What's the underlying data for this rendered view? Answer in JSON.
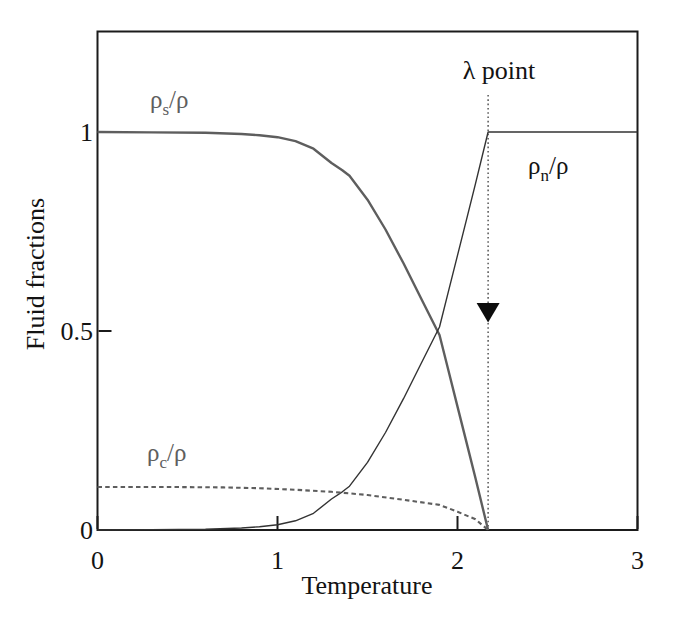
{
  "figure": {
    "ylabel": "Fluid fractions",
    "xlabel": "Temperature",
    "x_ticks": [
      {
        "value": 0,
        "label": "0"
      },
      {
        "value": 1,
        "label": "1"
      },
      {
        "value": 2,
        "label": "2"
      },
      {
        "value": 3,
        "label": "3"
      }
    ],
    "y_ticks": [
      {
        "value": 0,
        "label": "0"
      },
      {
        "value": 0.5,
        "label": "0.5"
      },
      {
        "value": 1,
        "label": "1"
      }
    ],
    "curve_labels": {
      "superfluid": {
        "pre": "ρ",
        "sub": "s",
        "post": "/ρ"
      },
      "normal": {
        "pre": "ρ",
        "sub": "n",
        "post": "/ρ"
      },
      "condensate": {
        "pre": "ρ",
        "sub": "c",
        "post": "/ρ"
      }
    },
    "lambda_label": "λ point",
    "colors": {
      "gray_curve": "#5e5e5e",
      "dark_curve": "#333333",
      "axis": "#1b1b1b",
      "text": "#131313",
      "arrow": "#0d0d0d",
      "background": "#ffffff"
    }
  },
  "chart_data": {
    "type": "line",
    "title": "",
    "xlabel": "Temperature",
    "ylabel": "Fluid fractions",
    "xlim": [
      0,
      3
    ],
    "ylim": [
      0,
      1.25
    ],
    "x_ticks": [
      0,
      1,
      2,
      3
    ],
    "y_ticks": [
      0,
      0.5,
      1
    ],
    "grid": false,
    "legend": "inline-labels",
    "series": [
      {
        "key": "superfluid",
        "name": "ρs/ρ",
        "style": "solid",
        "color": "#5e5e5e",
        "width": 2.4,
        "dash": null,
        "points": [
          [
            0,
            1.0
          ],
          [
            0.3,
            0.999
          ],
          [
            0.6,
            0.998
          ],
          [
            0.8,
            0.995
          ],
          [
            0.9,
            0.992
          ],
          [
            1.0,
            0.987
          ],
          [
            1.1,
            0.977
          ],
          [
            1.2,
            0.958
          ],
          [
            1.3,
            0.922
          ],
          [
            1.36,
            0.904
          ],
          [
            1.4,
            0.89
          ],
          [
            1.5,
            0.83
          ],
          [
            1.6,
            0.755
          ],
          [
            1.7,
            0.67
          ],
          [
            1.8,
            0.58
          ],
          [
            1.9,
            0.49
          ],
          [
            1.95,
            0.4
          ],
          [
            2.0,
            0.31
          ],
          [
            2.05,
            0.22
          ],
          [
            2.1,
            0.13
          ],
          [
            2.17,
            0.0
          ]
        ]
      },
      {
        "key": "normal",
        "name": "ρn/ρ",
        "style": "solid",
        "color": "#333333",
        "width": 1.4,
        "dash": null,
        "points": [
          [
            0,
            0.0
          ],
          [
            0.3,
            0.001
          ],
          [
            0.6,
            0.002
          ],
          [
            0.8,
            0.005
          ],
          [
            0.9,
            0.008
          ],
          [
            1.0,
            0.013
          ],
          [
            1.1,
            0.023
          ],
          [
            1.2,
            0.042
          ],
          [
            1.3,
            0.078
          ],
          [
            1.36,
            0.096
          ],
          [
            1.4,
            0.11
          ],
          [
            1.5,
            0.17
          ],
          [
            1.6,
            0.245
          ],
          [
            1.7,
            0.33
          ],
          [
            1.8,
            0.42
          ],
          [
            1.9,
            0.51
          ],
          [
            1.95,
            0.6
          ],
          [
            2.0,
            0.69
          ],
          [
            2.05,
            0.78
          ],
          [
            2.1,
            0.87
          ],
          [
            2.17,
            1.0
          ],
          [
            3.0,
            1.0
          ]
        ]
      },
      {
        "key": "condensate",
        "name": "ρc/ρ",
        "style": "dashed",
        "color": "#5e5e5e",
        "width": 2.1,
        "dash": "4.5 3.2",
        "points": [
          [
            0,
            0.108
          ],
          [
            0.4,
            0.108
          ],
          [
            0.7,
            0.107
          ],
          [
            0.9,
            0.105
          ],
          [
            1.1,
            0.101
          ],
          [
            1.3,
            0.096
          ],
          [
            1.5,
            0.088
          ],
          [
            1.7,
            0.076
          ],
          [
            1.9,
            0.063
          ],
          [
            2.0,
            0.046
          ],
          [
            2.1,
            0.027
          ],
          [
            2.17,
            0.0
          ]
        ]
      }
    ],
    "annotations": {
      "lambda_point": {
        "label": "λ point",
        "T": 2.17,
        "line_style": "dotted",
        "line_top_value": 1.093,
        "line_bottom_value": 0,
        "arrow": {
          "T": 2.17,
          "direction": "down",
          "top_value": 0.57,
          "tip_value": 0.521,
          "half_width_T": 0.064
        }
      }
    }
  }
}
